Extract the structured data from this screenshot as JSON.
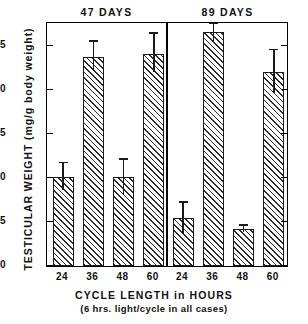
{
  "chart_data": {
    "type": "bar",
    "title": "",
    "ylabel": "TESTICULAR WEIGHT (mg/g body weight)",
    "xlabel": "CYCLE LENGTH in HOURS",
    "xsublabel": "(6 hrs. light/cycle in all cases)",
    "ylim": [
      0,
      27.5
    ],
    "yticks": [
      0,
      5,
      10,
      15,
      20,
      25
    ],
    "ytick_labels": [
      "0",
      "5",
      "10",
      "15",
      "20",
      "25"
    ],
    "grid": false,
    "legend": "none",
    "panels": [
      {
        "title": "47 DAYS",
        "categories": [
          "24",
          "36",
          "48",
          "60"
        ],
        "values": [
          10.1,
          23.8,
          10.1,
          24.1
        ],
        "err_low": [
          8.6,
          22.2,
          8.1,
          22.1
        ],
        "err_high": [
          11.7,
          25.5,
          12.1,
          26.4
        ]
      },
      {
        "title": "89 DAYS",
        "categories": [
          "24",
          "36",
          "48",
          "60"
        ],
        "values": [
          5.5,
          26.6,
          4.2,
          22.0
        ],
        "err_low": [
          3.6,
          25.6,
          3.9,
          19.7
        ],
        "err_high": [
          7.2,
          27.5,
          4.6,
          24.5
        ]
      }
    ],
    "bar_fill": "hatched-diagonal",
    "bar_edge_color": "#1a1a1a",
    "axis_color": "#000000",
    "background": "#ffffff"
  },
  "axis": {
    "ytick_0": "0",
    "ytick_1": "5",
    "ytick_2": "10",
    "ytick_3": "15",
    "ytick_4": "20",
    "ytick_5": "25"
  },
  "xticks": {
    "t0": "24",
    "t1": "36",
    "t2": "48",
    "t3": "60",
    "t4": "24",
    "t5": "36",
    "t6": "48",
    "t7": "60"
  },
  "panel_titles": {
    "left": "47 DAYS",
    "right": "89 DAYS"
  },
  "labels": {
    "ylabel": "TESTICULAR  WEIGHT  (mg/g body weight)",
    "xlabel": "CYCLE LENGTH in HOURS",
    "xsublabel": "(6 hrs. light/cycle in all cases)"
  }
}
